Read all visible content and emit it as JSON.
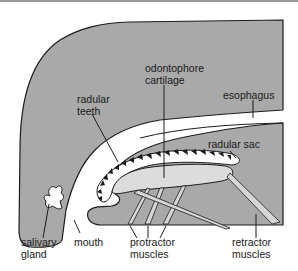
{
  "diagram": {
    "colors": {
      "tissue": "#a9a9a9",
      "cartilage": "#dcdcdc",
      "outline": "#1c1c1c",
      "background": "#ffffff",
      "frame_line": "#9a9a9a"
    },
    "labels": {
      "odontophore_cartilage": [
        "odontophore",
        "cartilage"
      ],
      "esophagus": "esophagus",
      "radular_teeth": [
        "radular",
        "teeth"
      ],
      "radular_sac": "radular sac",
      "salivary_gland": [
        "salivary",
        "gland"
      ],
      "mouth": "mouth",
      "protractor_muscles": [
        "protractor",
        "muscles"
      ],
      "retractor_muscles": [
        "retractor",
        "muscles"
      ]
    }
  }
}
